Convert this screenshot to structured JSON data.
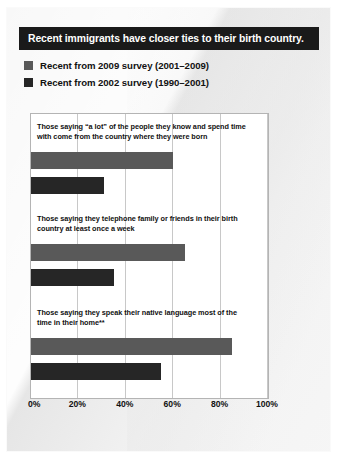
{
  "slide": {
    "title": "Recent immigrants have closer ties to their birth country."
  },
  "legend": {
    "items": [
      {
        "label": "Recent from 2009 survey (2001–2009)",
        "color": "#595959",
        "swatch_name": "legend-swatch-2009"
      },
      {
        "label": "Recent from 2002 survey (1990–2001)",
        "color": "#262626",
        "swatch_name": "legend-swatch-2002"
      }
    ]
  },
  "colors": {
    "title_bar": "#1a1a1a",
    "series_2009": "#595959",
    "series_2002": "#262626",
    "gridline": "#c8c8c8",
    "plot_border": "#b4b4b4",
    "page": "#f7f7f7"
  },
  "chart_data": {
    "type": "bar",
    "orientation": "horizontal",
    "title": "Recent immigrants have closer ties to their birth country.",
    "xlabel": "",
    "ylabel": "",
    "xlim": [
      0,
      100
    ],
    "xticks": [
      0,
      20,
      40,
      60,
      80,
      100
    ],
    "xtick_labels": [
      "0%",
      "20%",
      "40%",
      "60%",
      "80%",
      "100%"
    ],
    "grid": true,
    "legend_position": "above-plot",
    "categories": [
      "Those saying “a lot” of the people they know and spend time with come from the country where they were born",
      "Those saying they telephone family or friends in their birth country at least once a week",
      "Those saying they speak their native language most of the time in their home**"
    ],
    "series": [
      {
        "name": "Recent from 2009 survey (2001–2009)",
        "color": "#595959",
        "values": [
          60,
          65,
          85
        ]
      },
      {
        "name": "Recent from 2002 survey (1990–2001)",
        "color": "#262626",
        "values": [
          31,
          35,
          55
        ]
      }
    ]
  }
}
